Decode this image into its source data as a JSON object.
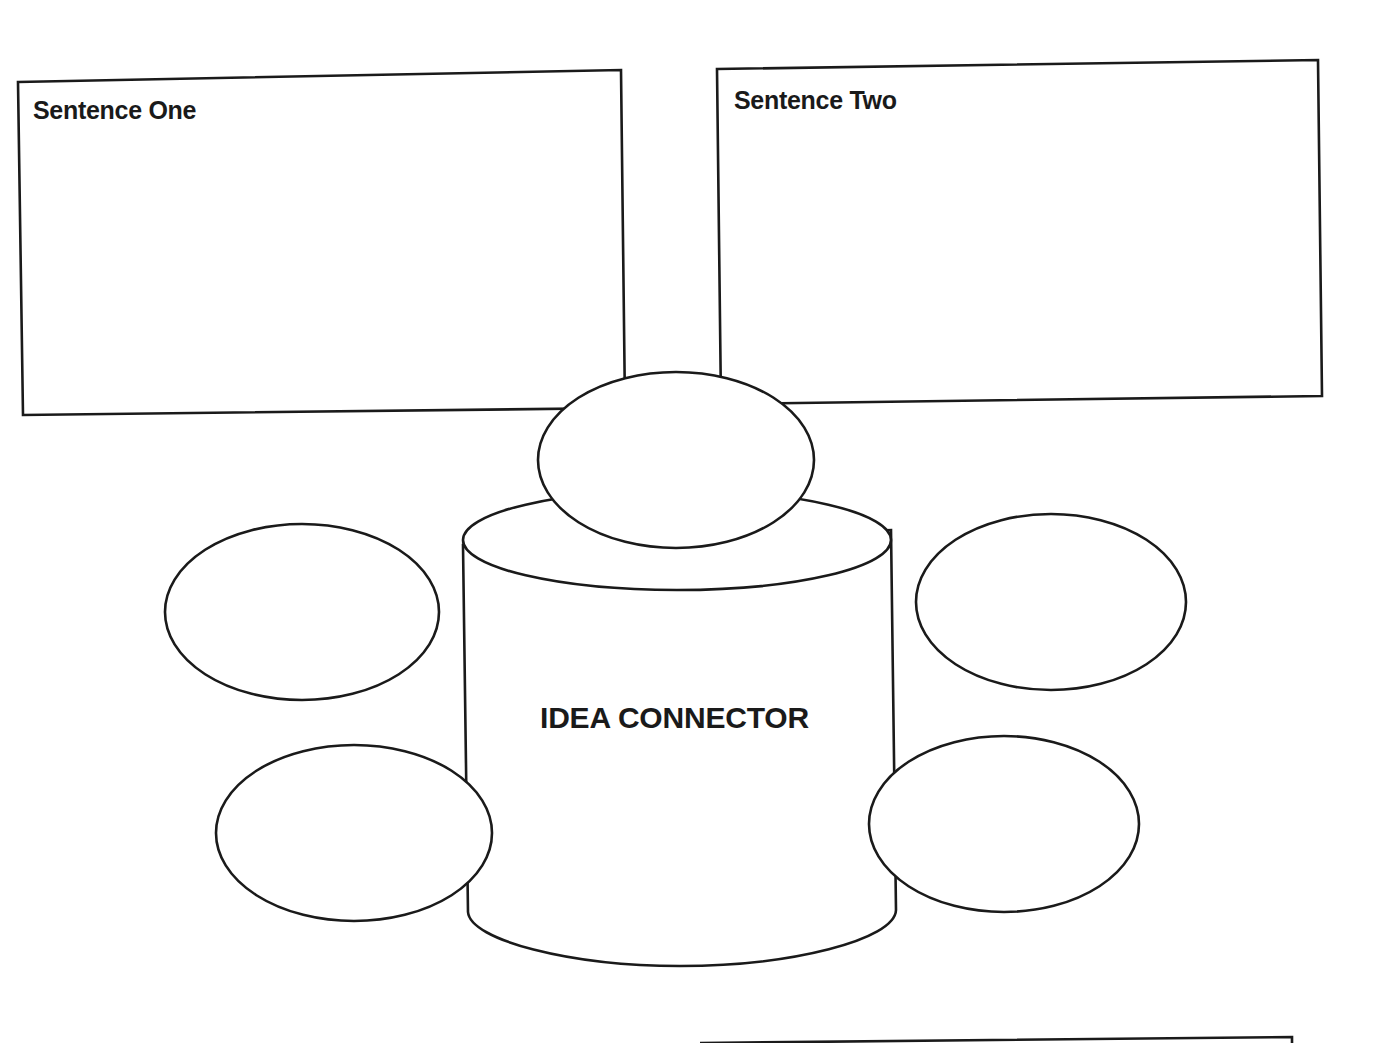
{
  "diagram": {
    "title": "IDEA CONNECTOR",
    "boxes": [
      {
        "id": "sentence-one",
        "label": "Sentence One",
        "content": ""
      },
      {
        "id": "sentence-two",
        "label": "Sentence Two",
        "content": ""
      }
    ],
    "ovals": [
      {
        "id": "top",
        "content": ""
      },
      {
        "id": "left-upper",
        "content": ""
      },
      {
        "id": "left-lower",
        "content": ""
      },
      {
        "id": "right-upper",
        "content": ""
      },
      {
        "id": "right-lower",
        "content": ""
      }
    ],
    "colors": {
      "stroke": "#1a1a1a",
      "background": "#ffffff"
    }
  }
}
